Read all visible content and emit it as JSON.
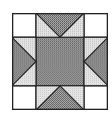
{
  "diagram": {
    "type": "quilt-block",
    "pattern": "sawtooth-star",
    "grid": 4,
    "colors": {
      "background": "#ffffff",
      "dark": "#8a8a8a",
      "light": "#d6d6d6",
      "corner": "#ffffff",
      "stroke": "#222222"
    }
  }
}
